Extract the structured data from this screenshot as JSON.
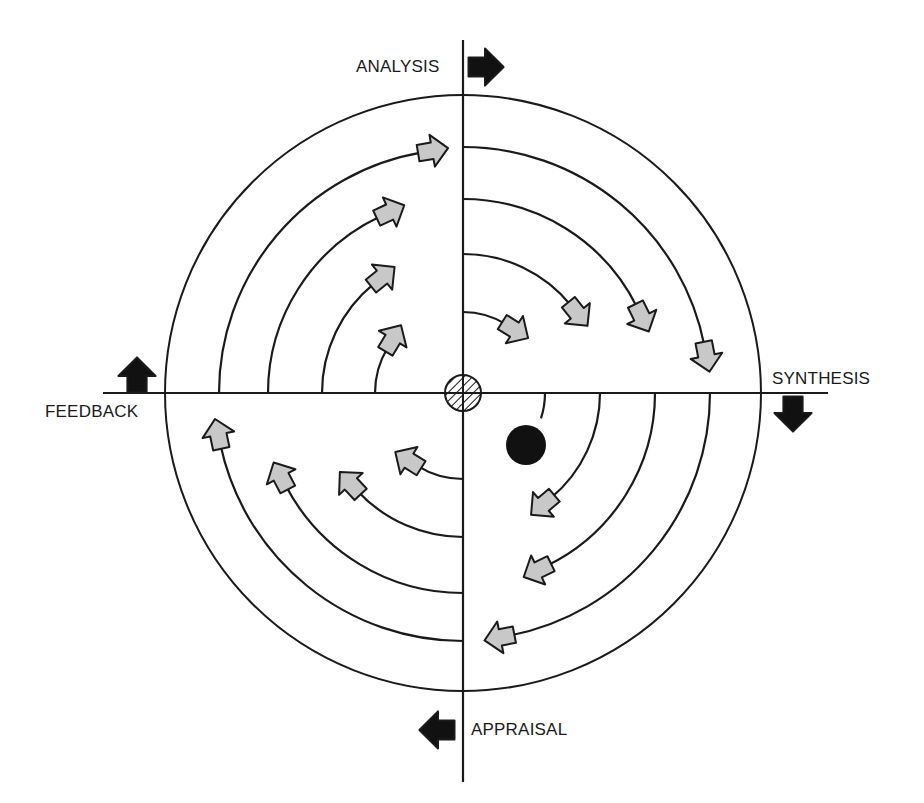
{
  "diagram": {
    "type": "circular process cycle",
    "center": [
      463,
      393
    ],
    "outer_circle_radius": 298,
    "hub": {
      "radius": 18,
      "pattern": "hatched"
    },
    "stroke_color": "#1a1a1a",
    "arrow_fill": "#c8c8c8",
    "dot_color": "#111111",
    "axis": {
      "vertical": [
        40,
        782
      ],
      "horizontal": [
        103,
        828
      ]
    }
  },
  "labels": {
    "top": "ANALYSIS",
    "right": "SYNTHESIS",
    "bottom": "APPRAISAL",
    "left": "FEEDBACK"
  },
  "direction_arrows": [
    {
      "name": "analysis-direction-arrow",
      "points_to": "right",
      "pos": [
        485,
        67
      ]
    },
    {
      "name": "synthesis-direction-arrow",
      "points_to": "down",
      "pos": [
        793,
        413
      ]
    },
    {
      "name": "appraisal-direction-arrow",
      "points_to": "left",
      "pos": [
        438,
        730
      ]
    },
    {
      "name": "feedback-direction-arrow",
      "points_to": "up",
      "pos": [
        137,
        376
      ]
    }
  ],
  "quadrants": [
    {
      "name": "analysis-quadrant",
      "arcs": [
        {
          "r": 88,
          "start": 180,
          "end": 149,
          "end_marker": "arrow"
        },
        {
          "r": 141,
          "start": 180,
          "end": 129,
          "end_marker": "arrow"
        },
        {
          "r": 195,
          "start": 180,
          "end": 115,
          "end_marker": "arrow"
        },
        {
          "r": 244,
          "start": 180,
          "end": 99.6,
          "end_marker": "arrow"
        }
      ]
    },
    {
      "name": "synthesis-quadrant",
      "arcs": [
        {
          "r": 81,
          "start": 90,
          "end": 58,
          "end_marker": "arrow"
        },
        {
          "r": 139,
          "start": 90,
          "end": 39,
          "end_marker": "arrow"
        },
        {
          "r": 194,
          "start": 90,
          "end": 26,
          "end_marker": "arrow"
        },
        {
          "r": 246,
          "start": 90,
          "end": 11,
          "end_marker": "arrow"
        }
      ]
    },
    {
      "name": "appraisal-quadrant",
      "arcs": [
        {
          "r": 82,
          "start": 0,
          "end": -18,
          "end_marker": "dot"
        },
        {
          "r": 137,
          "start": 0,
          "end": -50,
          "end_marker": "arrow"
        },
        {
          "r": 192,
          "start": 0,
          "end": -64,
          "end_marker": "arrow"
        },
        {
          "r": 247,
          "start": 0,
          "end": -79,
          "end_marker": "arrow"
        }
      ]
    },
    {
      "name": "feedback-quadrant",
      "arcs": [
        {
          "r": 86,
          "start": 270,
          "end": 238,
          "end_marker": "arrow"
        },
        {
          "r": 144,
          "start": 270,
          "end": 223,
          "end_marker": "arrow"
        },
        {
          "r": 200,
          "start": 270,
          "end": 207.6,
          "end_marker": "arrow"
        },
        {
          "r": 248,
          "start": 270,
          "end": 192,
          "end_marker": "arrow"
        }
      ]
    }
  ],
  "dot": {
    "pos": [
      526,
      445
    ],
    "radius": 20
  }
}
